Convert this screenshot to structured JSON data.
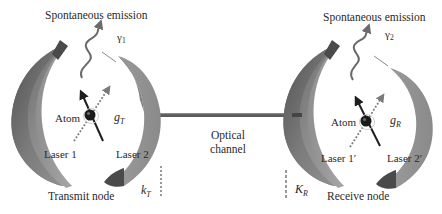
{
  "transmit": {
    "emission_label": "Spontaneous emission",
    "gamma_symbol": "γ",
    "gamma_sub": "1",
    "atom_label": "Atom",
    "coupling_symbol": "g",
    "coupling_sub": "T",
    "laser1_label": "Laser 1",
    "laser2_label": "Laser 2",
    "decay_symbol": "k",
    "decay_sub": "T",
    "node_label": "Transmit node"
  },
  "channel": {
    "line1": "Optical",
    "line2": "channel"
  },
  "receive": {
    "emission_label": "Spontaneous emission",
    "gamma_symbol": "γ",
    "gamma_sub": "2",
    "atom_label": "Atom",
    "coupling_symbol": "g",
    "coupling_sub": "R",
    "laser1_label": "Laser 1′",
    "laser2_label": "Laser 2′",
    "decay_symbol": "K",
    "decay_sub": "R",
    "node_label": "Receive node"
  },
  "colors": {
    "mirror_dark": "#5e5e5e",
    "mirror_mid": "#8a8a8a",
    "mirror_light": "#a9a9a9",
    "channel_line": "#555555",
    "atom": "#1a1a1a",
    "arrow": "#1e1e1e",
    "dotted_arrow": "#7a7a7a",
    "emission_wave": "#6a6a6a"
  }
}
